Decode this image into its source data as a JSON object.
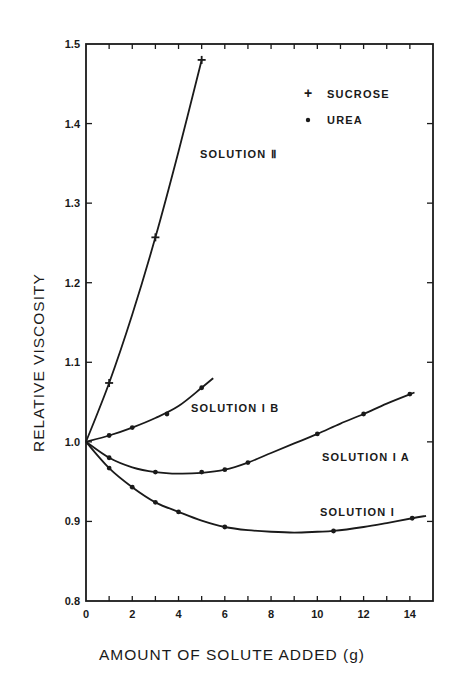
{
  "chart_data": {
    "type": "line",
    "title": "",
    "xlabel": "AMOUNT OF SOLUTE ADDED (g)",
    "ylabel": "RELATIVE VISCOSITY",
    "xlim": [
      0,
      15
    ],
    "ylim": [
      0.8,
      1.5
    ],
    "x_ticks": [
      0,
      2,
      4,
      6,
      8,
      10,
      12,
      14
    ],
    "x_tick_labels": [
      "0",
      "2",
      "4",
      "6",
      "8",
      "10",
      "12",
      "14"
    ],
    "y_ticks": [
      0.8,
      0.9,
      1.0,
      1.1,
      1.2,
      1.3,
      1.4,
      1.5
    ],
    "y_tick_labels": [
      "0.8",
      "0.9",
      "1.0",
      "1.1",
      "1.2",
      "1.3",
      "1.4",
      "1.5"
    ],
    "grid": false,
    "legend": {
      "position": "upper right",
      "entries": [
        {
          "marker": "+",
          "label": "SUCROSE"
        },
        {
          "marker": "•",
          "label": "UREA"
        }
      ]
    },
    "series": [
      {
        "name": "SOLUTION II",
        "marker": "+",
        "points": [
          [
            0,
            1.0
          ],
          [
            1,
            1.074
          ],
          [
            3,
            1.257
          ],
          [
            5,
            1.48
          ]
        ],
        "curve": [
          [
            0,
            1.0
          ],
          [
            1,
            1.074
          ],
          [
            2,
            1.16
          ],
          [
            3,
            1.257
          ],
          [
            4,
            1.365
          ],
          [
            5,
            1.48
          ]
        ]
      },
      {
        "name": "SOLUTION IB",
        "marker": "•",
        "points": [
          [
            0,
            1.0
          ],
          [
            1,
            1.008
          ],
          [
            2,
            1.018
          ],
          [
            3.5,
            1.035
          ],
          [
            5,
            1.068
          ]
        ],
        "curve": [
          [
            0,
            1.0
          ],
          [
            1,
            1.008
          ],
          [
            2,
            1.018
          ],
          [
            3,
            1.03
          ],
          [
            4,
            1.045
          ],
          [
            5,
            1.068
          ],
          [
            5.5,
            1.08
          ]
        ]
      },
      {
        "name": "SOLUTION IA",
        "marker": "•",
        "points": [
          [
            0,
            1.0
          ],
          [
            1,
            0.98
          ],
          [
            3,
            0.962
          ],
          [
            5,
            0.962
          ],
          [
            6,
            0.965
          ],
          [
            7,
            0.974
          ],
          [
            10,
            1.01
          ],
          [
            12,
            1.035
          ],
          [
            14,
            1.06
          ]
        ],
        "curve": [
          [
            0,
            1.0
          ],
          [
            1,
            0.98
          ],
          [
            2,
            0.968
          ],
          [
            3,
            0.962
          ],
          [
            4,
            0.96
          ],
          [
            5,
            0.961
          ],
          [
            6,
            0.965
          ],
          [
            7,
            0.974
          ],
          [
            8,
            0.986
          ],
          [
            9,
            0.998
          ],
          [
            10,
            1.01
          ],
          [
            11,
            1.023
          ],
          [
            12,
            1.035
          ],
          [
            13,
            1.048
          ],
          [
            14.2,
            1.062
          ]
        ]
      },
      {
        "name": "SOLUTION I",
        "marker": "•",
        "points": [
          [
            0,
            1.0
          ],
          [
            1,
            0.967
          ],
          [
            2,
            0.943
          ],
          [
            3,
            0.924
          ],
          [
            4,
            0.912
          ],
          [
            6,
            0.893
          ],
          [
            10.7,
            0.888
          ],
          [
            14.1,
            0.904
          ]
        ],
        "curve": [
          [
            0,
            1.0
          ],
          [
            1,
            0.967
          ],
          [
            2,
            0.943
          ],
          [
            3,
            0.924
          ],
          [
            4,
            0.912
          ],
          [
            5,
            0.901
          ],
          [
            6,
            0.893
          ],
          [
            7,
            0.889
          ],
          [
            8,
            0.887
          ],
          [
            9,
            0.886
          ],
          [
            10,
            0.887
          ],
          [
            10.7,
            0.888
          ],
          [
            12,
            0.893
          ],
          [
            13,
            0.898
          ],
          [
            14.1,
            0.904
          ],
          [
            14.7,
            0.907
          ]
        ]
      }
    ],
    "annotations": [
      {
        "text": "SOLUTION Ⅱ",
        "x": 5.0,
        "y": 1.36
      },
      {
        "text": "SOLUTION I B",
        "x": 4.6,
        "y": 1.07
      },
      {
        "text": "SOLUTION I A",
        "x": 10.2,
        "y": 0.985
      },
      {
        "text": "SOLUTION I",
        "x": 10.2,
        "y": 0.912
      }
    ]
  },
  "legend": {
    "sucrose_label": "SUCROSE",
    "urea_label": "UREA"
  },
  "labels": {
    "solution_ii": "SOLUTION  Ⅱ",
    "solution_ib": "SOLUTION  I B",
    "solution_ia": "SOLUTION  I A",
    "solution_i": "SOLUTION  I"
  },
  "axes": {
    "xlabel": "AMOUNT  OF  SOLUTE  ADDED  (g)",
    "ylabel": "RELATIVE  VISCOSITY"
  }
}
